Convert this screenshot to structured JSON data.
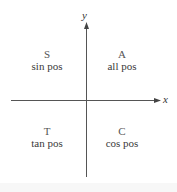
{
  "diagram": {
    "axes": {
      "x_label": "x",
      "y_label": "y",
      "line_color": "#555555"
    },
    "quadrants": [
      {
        "position": "top-left",
        "letter": "S",
        "description": "sin pos"
      },
      {
        "position": "top-right",
        "letter": "A",
        "description": "all pos"
      },
      {
        "position": "bottom-left",
        "letter": "T",
        "description": "tan pos"
      },
      {
        "position": "bottom-right",
        "letter": "C",
        "description": "cos pos"
      }
    ]
  }
}
